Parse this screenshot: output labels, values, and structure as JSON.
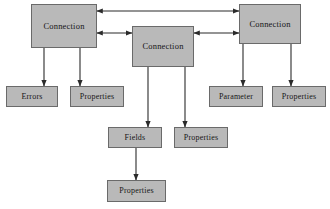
{
  "diagram": {
    "background_color": "#ffffff",
    "node_fill_color": "#b9b9b9",
    "node_border_color": "#6a6a6a",
    "edge_color": "#2b2b2b",
    "text_color": "#161616",
    "nodes": [
      {
        "id": "connection-left",
        "label": "Connection",
        "x": 31,
        "y": 4,
        "w": 66,
        "h": 44,
        "size": "big"
      },
      {
        "id": "connection-middle",
        "label": "Connection",
        "x": 132,
        "y": 26,
        "w": 62,
        "h": 41,
        "size": "big"
      },
      {
        "id": "connection-right",
        "label": "Connection",
        "x": 239,
        "y": 4,
        "w": 62,
        "h": 40,
        "size": "big"
      },
      {
        "id": "errors",
        "label": "Errors",
        "x": 6,
        "y": 86,
        "w": 52,
        "h": 21,
        "size": "small"
      },
      {
        "id": "properties-left",
        "label": "Properties",
        "x": 70,
        "y": 86,
        "w": 54,
        "h": 21,
        "size": "small"
      },
      {
        "id": "parameter",
        "label": "Parameter",
        "x": 209,
        "y": 86,
        "w": 54,
        "h": 21,
        "size": "small"
      },
      {
        "id": "properties-right",
        "label": "Properties",
        "x": 272,
        "y": 86,
        "w": 54,
        "h": 21,
        "size": "small"
      },
      {
        "id": "fields",
        "label": "Fields",
        "x": 108,
        "y": 127,
        "w": 54,
        "h": 21,
        "size": "small"
      },
      {
        "id": "properties-middle",
        "label": "Properties",
        "x": 174,
        "y": 127,
        "w": 54,
        "h": 21,
        "size": "small"
      },
      {
        "id": "properties-bottom",
        "label": "Properties",
        "x": 107,
        "y": 180,
        "w": 59,
        "h": 22,
        "size": "small"
      }
    ],
    "edges": [
      {
        "id": "left-to-right-top",
        "from": "connection-left",
        "to": "connection-right",
        "x1": 97,
        "y1": 11,
        "x2": 239,
        "y2": 11,
        "arrows": "both"
      },
      {
        "id": "left-to-middle",
        "from": "connection-left",
        "to": "connection-middle",
        "x1": 97,
        "y1": 33,
        "x2": 132,
        "y2": 33,
        "arrows": "both"
      },
      {
        "id": "middle-to-right",
        "from": "connection-middle",
        "to": "connection-right",
        "x1": 194,
        "y1": 33,
        "x2": 239,
        "y2": 33,
        "arrows": "both"
      },
      {
        "id": "left-to-errors",
        "from": "connection-left",
        "to": "errors",
        "x1": 44,
        "y1": 48,
        "x2": 44,
        "y2": 86,
        "arrows": "end"
      },
      {
        "id": "left-to-properties",
        "from": "connection-left",
        "to": "properties-left",
        "x1": 80,
        "y1": 48,
        "x2": 80,
        "y2": 86,
        "arrows": "end"
      },
      {
        "id": "right-to-parameter",
        "from": "connection-right",
        "to": "parameter",
        "x1": 243,
        "y1": 44,
        "x2": 243,
        "y2": 86,
        "arrows": "end"
      },
      {
        "id": "right-to-properties",
        "from": "connection-right",
        "to": "properties-right",
        "x1": 291,
        "y1": 44,
        "x2": 291,
        "y2": 86,
        "arrows": "end"
      },
      {
        "id": "middle-to-fields",
        "from": "connection-middle",
        "to": "fields",
        "x1": 148,
        "y1": 67,
        "x2": 148,
        "y2": 127,
        "arrows": "end"
      },
      {
        "id": "middle-to-properties",
        "from": "connection-middle",
        "to": "properties-middle",
        "x1": 185,
        "y1": 67,
        "x2": 185,
        "y2": 127,
        "arrows": "end"
      },
      {
        "id": "fields-to-properties",
        "from": "fields",
        "to": "properties-bottom",
        "x1": 136,
        "y1": 148,
        "x2": 136,
        "y2": 180,
        "arrows": "end"
      }
    ]
  }
}
